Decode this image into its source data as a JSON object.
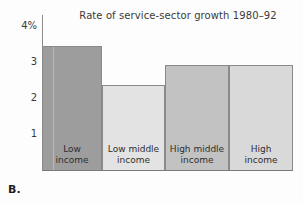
{
  "chart_data": {
    "type": "bar",
    "title": "Rate of service-sector growth 1980–92",
    "xlabel": "",
    "ylabel": "",
    "categories": [
      "Low income",
      "Low middle income",
      "High middle income",
      "High income"
    ],
    "category_lines": [
      [
        "Low",
        "income"
      ],
      [
        "Low middle",
        "income"
      ],
      [
        "High middle",
        "income"
      ],
      [
        "High",
        "income"
      ]
    ],
    "values": [
      3.45,
      2.35,
      2.9,
      2.9
    ],
    "ylim": [
      0,
      4.3
    ],
    "yticks": [
      4,
      3,
      2,
      1
    ],
    "ytick_labels": [
      "4%",
      "3",
      "2",
      "1"
    ],
    "grid": false,
    "legend": null,
    "bar_colors": [
      "#9d9d9d",
      "#e3e3e3",
      "#c2c2c2",
      "#d9d9d9"
    ],
    "bar_border_color": "#8a8a8a"
  },
  "figure": {
    "caption": "B.",
    "axis_color": "#8c8c8c",
    "background": "#fdfdfd",
    "text_color": "#3a3a3a"
  }
}
